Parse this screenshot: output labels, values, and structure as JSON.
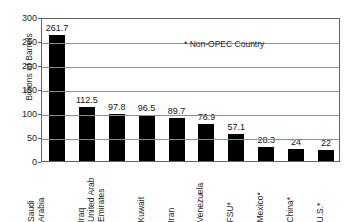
{
  "chart_data": {
    "type": "bar",
    "title": "",
    "xlabel": "",
    "ylabel": "Billions of Barrels",
    "ylim": [
      0,
      300
    ],
    "ytick_step": 50,
    "yticks": [
      300,
      250,
      200,
      150,
      100,
      50,
      0
    ],
    "grid": true,
    "legend": "none",
    "annotation": "* Non-OPEC Country",
    "bar_color": "#000000",
    "categories": [
      "Saudi Arabia",
      "Iraq",
      "United Arab Emirates",
      "Kuwait",
      "Iran",
      "Venezuela",
      "FSU*",
      "Mexico*",
      "China*",
      "U.S.*"
    ],
    "category_lines": [
      [
        "Saudi",
        "Arabia"
      ],
      [
        "Iraq"
      ],
      [
        "United Arab",
        "Emirates"
      ],
      [
        "Kuwait"
      ],
      [
        "Iran"
      ],
      [
        "Venezuela"
      ],
      [
        "FSU*"
      ],
      [
        "Mexico*"
      ],
      [
        "China*"
      ],
      [
        "U.S.*"
      ]
    ],
    "values": [
      261.7,
      112.5,
      97.8,
      96.5,
      89.7,
      76.9,
      57.1,
      28.3,
      24,
      22
    ],
    "value_labels": [
      "261.7",
      "112.5",
      "97.8",
      "96.5",
      "89.7",
      "76.9",
      "57.1",
      "28.3",
      "24",
      "22"
    ]
  }
}
